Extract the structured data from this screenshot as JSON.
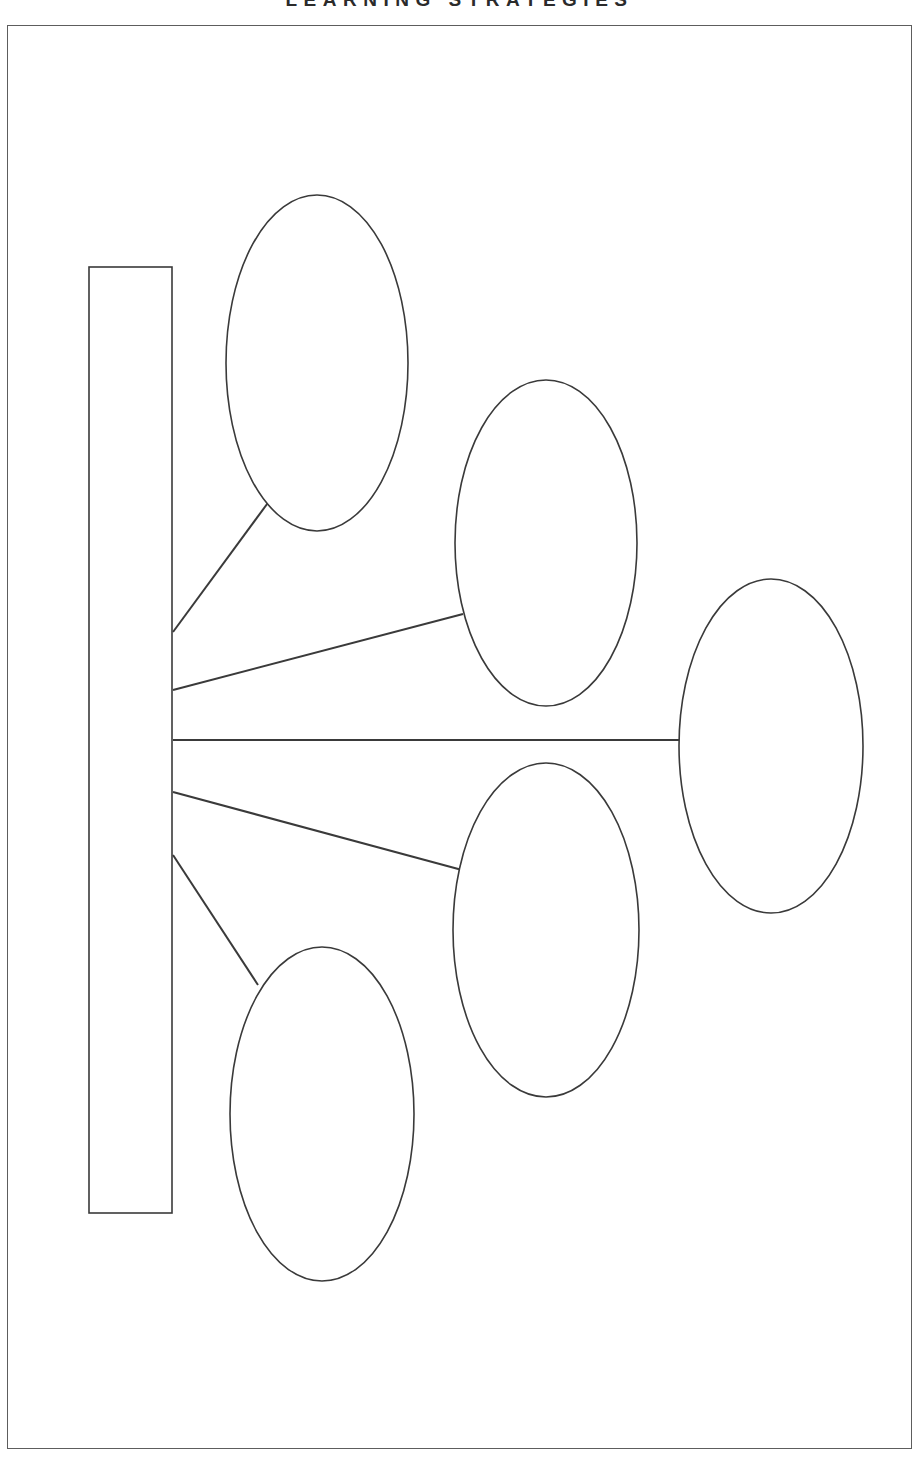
{
  "document": {
    "title": "LEARNING STRATEGIES",
    "title_clipped": true,
    "page_width": 919,
    "page_height": 1458,
    "background_color": "#ffffff",
    "frame": {
      "x": 7,
      "y": 25,
      "width": 905,
      "height": 1424,
      "stroke_color": "#5d5d5d",
      "stroke_width": 1
    }
  },
  "diagram": {
    "type": "concept-map",
    "variant": "blank-template",
    "stroke_color": "#3a3a3a",
    "fill_color": "#ffffff",
    "central_node": {
      "shape": "rectangle",
      "label": "",
      "x": 89,
      "y": 267,
      "width": 83,
      "height": 946,
      "orientation": "vertical"
    },
    "branch_nodes": [
      {
        "id": "node-1",
        "shape": "ellipse",
        "label": "",
        "cx": 317,
        "cy": 363,
        "rx": 91,
        "ry": 168
      },
      {
        "id": "node-2",
        "shape": "ellipse",
        "label": "",
        "cx": 546,
        "cy": 543,
        "rx": 91,
        "ry": 163
      },
      {
        "id": "node-3",
        "shape": "ellipse",
        "label": "",
        "cx": 771,
        "cy": 746,
        "rx": 92,
        "ry": 167
      },
      {
        "id": "node-4",
        "shape": "ellipse",
        "label": "",
        "cx": 546,
        "cy": 930,
        "rx": 93,
        "ry": 167
      },
      {
        "id": "node-5",
        "shape": "ellipse",
        "label": "",
        "cx": 322,
        "cy": 1114,
        "rx": 92,
        "ry": 167
      }
    ],
    "connectors": [
      {
        "id": "connector-1",
        "from": "central-node",
        "to": "node-1",
        "x1": 173,
        "y1": 632,
        "x2": 270,
        "y2": 500
      },
      {
        "id": "connector-2",
        "from": "central-node",
        "to": "node-2",
        "x1": 173,
        "y1": 690,
        "x2": 463,
        "y2": 614
      },
      {
        "id": "connector-3",
        "from": "central-node",
        "to": "node-3",
        "x1": 173,
        "y1": 740,
        "x2": 680,
        "y2": 740
      },
      {
        "id": "connector-4",
        "from": "central-node",
        "to": "node-4",
        "x1": 173,
        "y1": 792,
        "x2": 462,
        "y2": 870
      },
      {
        "id": "connector-5",
        "from": "central-node",
        "to": "node-5",
        "x1": 173,
        "y1": 855,
        "x2": 258,
        "y2": 985
      }
    ]
  }
}
